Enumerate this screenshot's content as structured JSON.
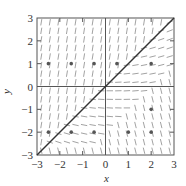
{
  "chart_data": {
    "type": "scatter",
    "subtype": "slope-field",
    "title": "",
    "xlabel": "x",
    "ylabel": "y",
    "xlim": [
      -3,
      3
    ],
    "ylim": [
      -3,
      3
    ],
    "x_ticks": [
      "-3",
      "-2",
      "-1",
      "0",
      "1",
      "2",
      "3"
    ],
    "y_ticks": [
      "-3",
      "-2",
      "-1",
      "0",
      "1",
      "2",
      "3"
    ],
    "grid": false,
    "legend": null,
    "reference_line": {
      "label": "y = x",
      "from": [
        -3,
        -3
      ],
      "to": [
        3,
        3
      ]
    },
    "points": [
      {
        "x": -2.5,
        "y": 1
      },
      {
        "x": -1.5,
        "y": 1
      },
      {
        "x": -0.5,
        "y": 1
      },
      {
        "x": 0.5,
        "y": 1
      },
      {
        "x": 2,
        "y": 1
      },
      {
        "x": -2.5,
        "y": -2
      },
      {
        "x": -1.5,
        "y": -2
      },
      {
        "x": -0.5,
        "y": -2
      },
      {
        "x": 1,
        "y": -2
      },
      {
        "x": 2,
        "y": -2
      },
      {
        "x": 2,
        "y": -1
      }
    ]
  },
  "colors": {
    "axis": "#555555",
    "segment": "#8a8a8a",
    "line": "#333333",
    "dot": "#555555"
  }
}
